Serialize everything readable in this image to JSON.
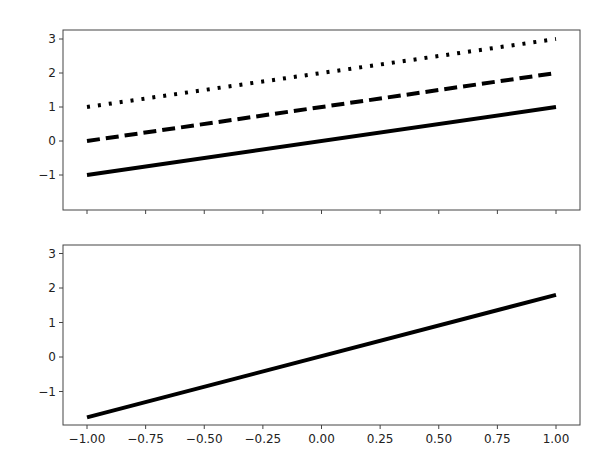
{
  "chart_data": [
    {
      "type": "line",
      "title": "",
      "xlabel": "",
      "ylabel": "",
      "xlim": [
        -1.1,
        1.1
      ],
      "ylim": [
        -2.0,
        3.25
      ],
      "x_ticks_labels_visible": false,
      "y_ticks": [
        -1,
        0,
        1,
        2,
        3
      ],
      "y_tick_labels": [
        "−1",
        "0",
        "1",
        "2",
        "3"
      ],
      "grid": false,
      "x": [
        -1.0,
        1.0
      ],
      "series": [
        {
          "name": "solid",
          "linestyle": "solid",
          "color": "#000000",
          "values": [
            -1.0,
            1.0
          ]
        },
        {
          "name": "dashed",
          "linestyle": "dashed",
          "color": "#000000",
          "values": [
            0.0,
            2.0
          ]
        },
        {
          "name": "dotted",
          "linestyle": "dotted",
          "color": "#000000",
          "values": [
            1.0,
            3.0
          ]
        }
      ]
    },
    {
      "type": "line",
      "title": "",
      "xlabel": "",
      "ylabel": "",
      "xlim": [
        -1.1,
        1.1
      ],
      "ylim": [
        -2.0,
        3.25
      ],
      "x_ticks": [
        -1.0,
        -0.75,
        -0.5,
        -0.25,
        0.0,
        0.25,
        0.5,
        0.75,
        1.0
      ],
      "x_tick_labels": [
        "−1.00",
        "−0.75",
        "−0.50",
        "−0.25",
        "0.00",
        "0.25",
        "0.50",
        "0.75",
        "1.00"
      ],
      "y_ticks": [
        -1,
        0,
        1,
        2,
        3
      ],
      "y_tick_labels": [
        "−1",
        "0",
        "1",
        "2",
        "3"
      ],
      "grid": false,
      "x": [
        -1.0,
        1.0
      ],
      "series": [
        {
          "name": "solid",
          "linestyle": "solid",
          "color": "#000000",
          "values": [
            -1.75,
            1.8
          ]
        }
      ]
    }
  ]
}
